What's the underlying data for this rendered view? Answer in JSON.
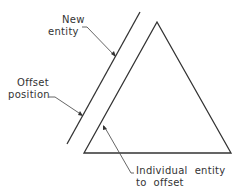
{
  "diagram": {
    "labels": {
      "new_entity": [
        "New",
        "entity"
      ],
      "offset_position": [
        "Offset",
        "position"
      ],
      "individual_entity": [
        "Individual  entity",
        "to  offset"
      ]
    },
    "colors": {
      "line": "#333333",
      "leader": "#555555",
      "background": "#ffffff"
    },
    "shapes": {
      "triangle": {
        "apex": [
          157,
          22
        ],
        "left": [
          84,
          153
        ],
        "right": [
          231,
          153
        ]
      },
      "offset_line": {
        "top": [
          140,
          12
        ],
        "bottom": [
          67,
          144
        ]
      }
    }
  }
}
